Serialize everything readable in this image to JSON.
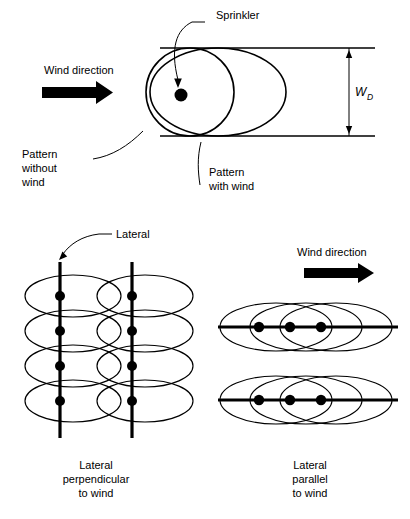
{
  "figure": {
    "background_color": "#ffffff",
    "line_color": "#000000"
  },
  "top_panel": {
    "name": "single-sprinkler-pattern",
    "wind_label": "Wind direction",
    "sprinkler_label": "Sprinkler",
    "pattern_without_wind_label": "Pattern\nwithout\nwind",
    "pattern_without_wind_lines": [
      "Pattern",
      "without",
      "wind"
    ],
    "pattern_with_wind_lines": [
      "Pattern",
      "with wind"
    ],
    "dimension_symbol": "W",
    "dimension_subscript": "D",
    "shapes": {
      "circle_label": "pattern without wind",
      "ellipse_label": "pattern with wind"
    }
  },
  "bottom_left_panel": {
    "name": "lateral-perpendicular-to-wind",
    "lateral_label": "Lateral",
    "caption_lines": [
      "Lateral",
      "perpendicular",
      "to wind"
    ],
    "lateral_count": 2,
    "sprinklers_per_lateral": 4
  },
  "bottom_right_panel": {
    "name": "lateral-parallel-to-wind",
    "wind_label": "Wind direction",
    "caption_lines": [
      "Lateral",
      "parallel",
      "to wind"
    ],
    "lateral_count": 2,
    "sprinklers_per_lateral": 3
  }
}
